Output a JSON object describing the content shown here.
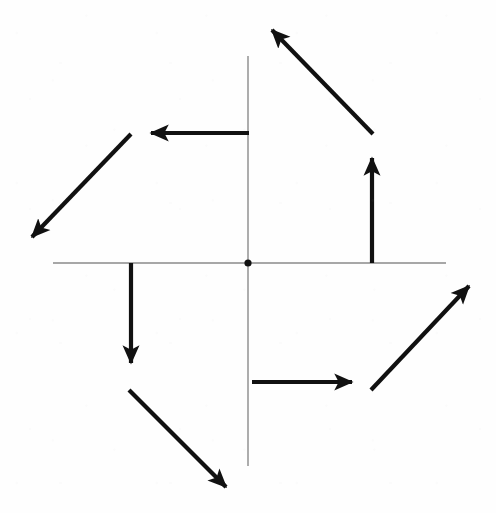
{
  "figure": {
    "title": "",
    "background_color": "#fefefe",
    "axis_color": "#8a8a8a",
    "arrow_color": "#111111",
    "width": 496,
    "height": 513
  },
  "chart_data": {
    "type": "scatter",
    "title": "",
    "subtitle": "",
    "xlabel": "",
    "ylabel": "",
    "legend": [],
    "grid": false,
    "annotations": [],
    "axes": {
      "origin": {
        "x": 248,
        "y": 263,
        "label": ""
      },
      "x_axis": {
        "x_start": 53,
        "x_end": 446,
        "y": 263,
        "tick_labels": []
      },
      "y_axis": {
        "y_start": 56,
        "y_end": 466,
        "x": 248,
        "tick_labels": []
      },
      "xlim": [
        53,
        446
      ],
      "ylim": [
        56,
        466
      ]
    },
    "origin_marker": {
      "name": "origin-point",
      "radius": 3.6
    },
    "series": [
      {
        "name": "rotational-vector-field",
        "description": "eight equal-length vectors arranged in a pinwheel / curl pattern about the origin",
        "vectors": [
          {
            "id": "v1",
            "label": "up-left-diagonal-upper-right-quadrant",
            "tail": {
              "x": 373,
              "y": 134
            },
            "tip": {
              "x": 272,
              "y": 30
            },
            "direction": "up-left",
            "angle_deg": 134,
            "length": 145
          },
          {
            "id": "v2",
            "label": "left-horizontal-upper-left-quadrant",
            "tail": {
              "x": 249,
              "y": 133
            },
            "tip": {
              "x": 151,
              "y": 133
            },
            "direction": "left",
            "angle_deg": 180,
            "length": 98
          },
          {
            "id": "v3",
            "label": "down-left-diagonal-upper-left-quadrant",
            "tail": {
              "x": 131,
              "y": 134
            },
            "tip": {
              "x": 32,
              "y": 237
            },
            "direction": "down-left",
            "angle_deg": 226,
            "length": 143
          },
          {
            "id": "v4",
            "label": "down-vertical-lower-left-quadrant",
            "tail": {
              "x": 131,
              "y": 263
            },
            "tip": {
              "x": 131,
              "y": 363
            },
            "direction": "down",
            "angle_deg": 270,
            "length": 100
          },
          {
            "id": "v5",
            "label": "down-right-diagonal-lower-left-quadrant",
            "tail": {
              "x": 129,
              "y": 390
            },
            "tip": {
              "x": 226,
              "y": 487
            },
            "direction": "down-right",
            "angle_deg": 315,
            "length": 137
          },
          {
            "id": "v6",
            "label": "right-horizontal-lower-right-quadrant",
            "tail": {
              "x": 252,
              "y": 382
            },
            "tip": {
              "x": 352,
              "y": 382
            },
            "direction": "right",
            "angle_deg": 0,
            "length": 100
          },
          {
            "id": "v7",
            "label": "up-right-diagonal-lower-right-quadrant",
            "tail": {
              "x": 371,
              "y": 390
            },
            "tip": {
              "x": 469,
              "y": 286
            },
            "direction": "up-right",
            "angle_deg": 46,
            "length": 143
          },
          {
            "id": "v8",
            "label": "up-vertical-upper-right-quadrant",
            "tail": {
              "x": 372,
              "y": 263
            },
            "tip": {
              "x": 372,
              "y": 158
            },
            "direction": "up",
            "angle_deg": 90,
            "length": 105
          }
        ]
      }
    ]
  }
}
